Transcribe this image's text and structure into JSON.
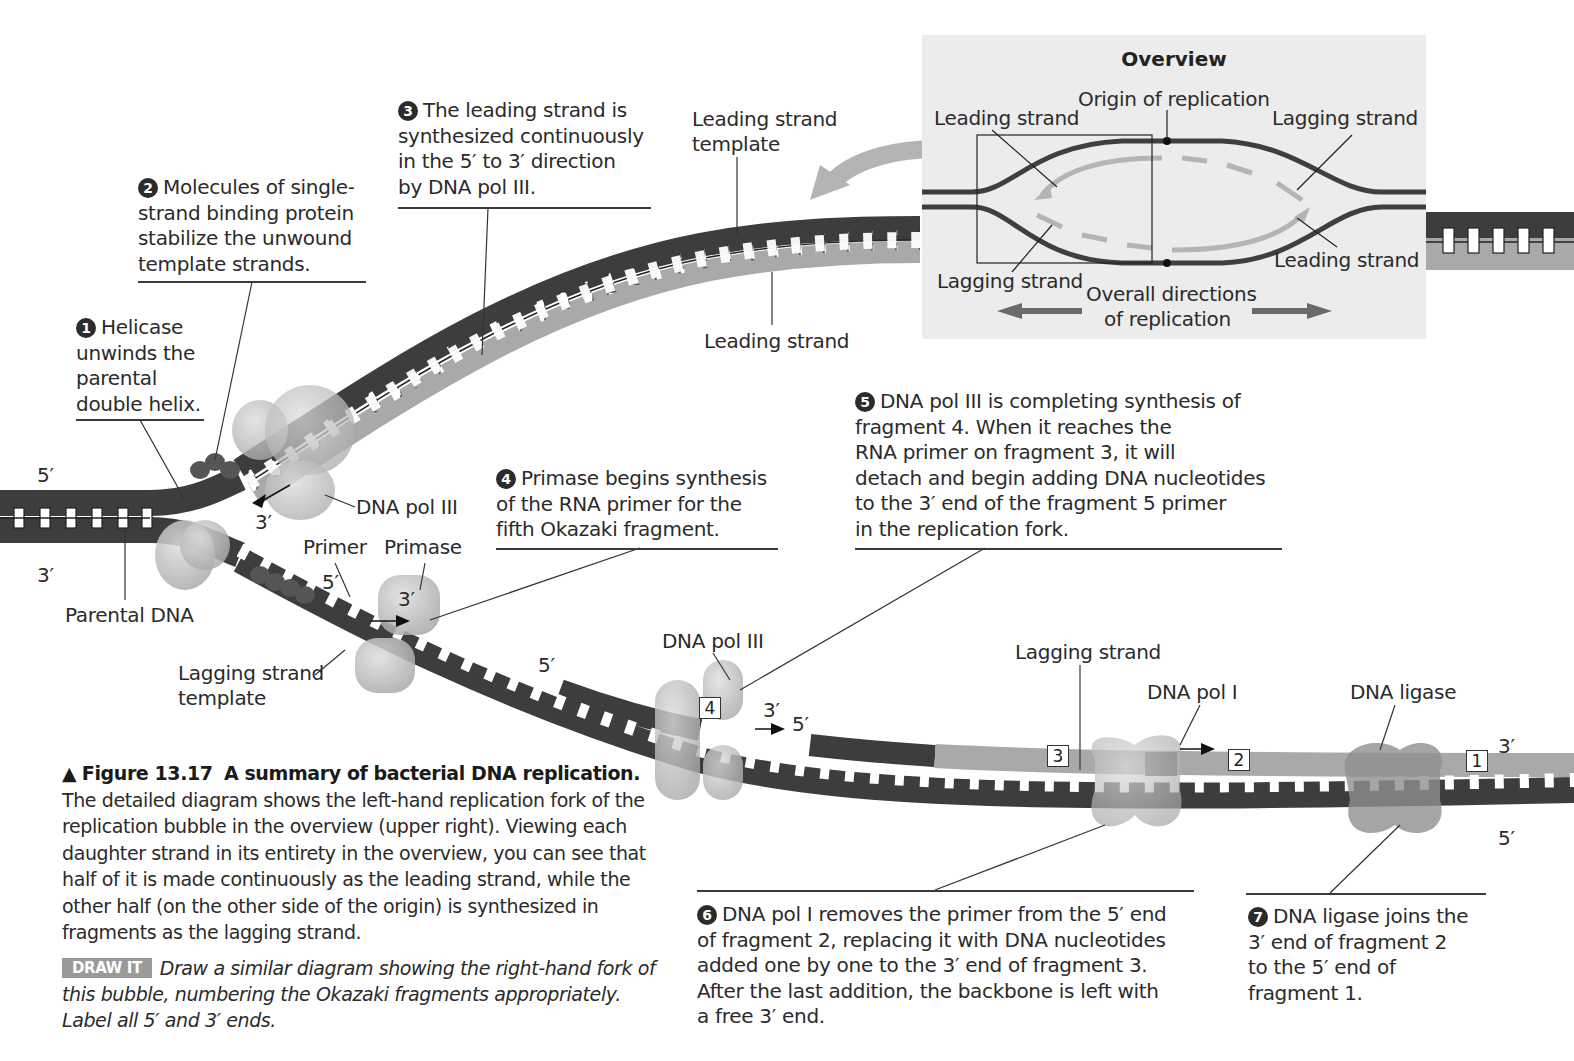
{
  "overview": {
    "title": "Overview",
    "origin_label": "Origin of replication",
    "leading_strand_top_left": "Leading strand",
    "lagging_strand_top_right": "Lagging strand",
    "lagging_strand_bottom_left": "Lagging strand",
    "leading_strand_bottom_right": "Leading strand",
    "directions_label_line1": "Overall directions",
    "directions_label_line2": "of replication"
  },
  "steps": [
    {
      "number": "1",
      "lines": [
        "Helicase",
        "unwinds the",
        "parental",
        "double helix."
      ]
    },
    {
      "number": "2",
      "lines": [
        "Molecules of single-",
        "strand binding protein",
        "stabilize the unwound",
        "template strands."
      ]
    },
    {
      "number": "3",
      "lines": [
        "The leading strand is",
        "synthesized continuously",
        "in the 5′ to 3′ direction",
        "by DNA pol III."
      ]
    },
    {
      "number": "4",
      "lines": [
        "Primase begins synthesis",
        "of the RNA primer for the",
        "fifth Okazaki fragment."
      ]
    },
    {
      "number": "5",
      "lines": [
        "DNA pol III is completing synthesis of",
        "fragment 4. When it reaches the",
        "RNA primer on fragment 3, it will",
        "detach and begin adding DNA nucleotides",
        "to the 3′ end of the fragment 5 primer",
        "in the replication fork."
      ]
    },
    {
      "number": "6",
      "lines": [
        "DNA pol I removes the primer from the 5′ end",
        "of fragment 2, replacing it with DNA nucleotides",
        "added one by one to the 3′ end of fragment 3.",
        "After the last addition, the backbone is left with",
        "a free 3′ end."
      ]
    },
    {
      "number": "7",
      "lines": [
        "DNA ligase joins the",
        "3′ end of fragment 2",
        "to the 5′ end of",
        "fragment 1."
      ]
    }
  ],
  "labels": {
    "leading_strand_template": [
      "Leading strand",
      "template"
    ],
    "leading_strand": "Leading strand",
    "dna_pol_iii_top": "DNA pol III",
    "primer": "Primer",
    "primase": "Primase",
    "parental_dna": "Parental DNA",
    "lagging_strand_template": [
      "Lagging strand",
      "template"
    ],
    "dna_pol_iii_bottom": "DNA pol III",
    "lagging_strand": "Lagging strand",
    "dna_pol_i": "DNA pol I",
    "dna_ligase": "DNA ligase",
    "end_5_left_top": "5′",
    "end_3_left_bottom": "3′",
    "end_3_pol": "3′",
    "end_5_primer": "5′",
    "end_3_primase": "3′",
    "end_5_frag4": "5′",
    "end_3_frag4": "3′",
    "end_5_frag3": "5′",
    "end_3_right": "3′",
    "end_5_right": "5′"
  },
  "fragments": {
    "f1": "1",
    "f2": "2",
    "f3": "3",
    "f4": "4"
  },
  "caption": {
    "marker": "▲",
    "figure_number": "Figure 13.17",
    "title": "A summary of bacterial DNA replication.",
    "body": "The detailed diagram shows the left-hand replication fork of the replication bubble in the overview (upper right). Viewing each daughter strand in its entirety in the overview, you can see that half of it is made continuously as the leading strand, while the other half (on the other side of the origin) is synthesized in fragments as the lagging strand."
  },
  "draw_it": {
    "badge": "DRAW IT",
    "text": "Draw a similar diagram showing the right-hand fork of this bubble, numbering the Okazaki fragments appropriately. Label all 5′ and 3′ ends."
  },
  "colors": {
    "parental_strand": "#3d3d3d",
    "new_strand": "#a9a9a9",
    "overview_bg": "#ececec",
    "protein": "#bdbdbd",
    "arrow": "#b4b4b4"
  }
}
